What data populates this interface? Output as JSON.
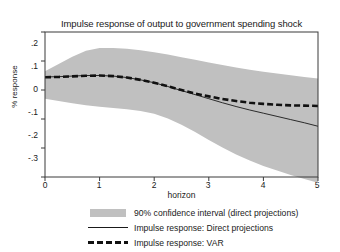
{
  "chart_data": {
    "type": "line",
    "title": "Impulse response of output to government spending shock",
    "xlabel": "horizon",
    "ylabel": "% response",
    "xlim": [
      0,
      5
    ],
    "ylim": [
      -0.3,
      0.2
    ],
    "xticks": [
      "0",
      "1",
      "2",
      "3",
      "4",
      "5"
    ],
    "xtick_values": [
      0,
      1,
      2,
      3,
      4,
      5
    ],
    "yticks": [
      ".2",
      ".1",
      "0",
      "-.1",
      "-.2",
      "-.3"
    ],
    "ytick_values": [
      0.2,
      0.1,
      0,
      -0.1,
      -0.2,
      -0.3
    ],
    "grid": false,
    "legend_position": "below",
    "x": [
      0,
      0.25,
      0.5,
      0.75,
      1,
      1.25,
      1.5,
      1.75,
      2,
      2.25,
      2.5,
      2.75,
      3,
      3.25,
      3.5,
      3.75,
      4,
      4.25,
      4.5,
      4.75,
      5
    ],
    "band": {
      "name": "90% confidence interval (direct projections)",
      "color": "#c0c0c0",
      "upper": [
        0.065,
        0.09,
        0.115,
        0.135,
        0.145,
        0.145,
        0.142,
        0.137,
        0.13,
        0.122,
        0.113,
        0.104,
        0.095,
        0.086,
        0.078,
        0.07,
        0.063,
        0.057,
        0.051,
        0.045,
        0.04
      ],
      "lower": [
        -0.03,
        -0.038,
        -0.046,
        -0.053,
        -0.058,
        -0.062,
        -0.066,
        -0.072,
        -0.082,
        -0.098,
        -0.12,
        -0.145,
        -0.172,
        -0.198,
        -0.222,
        -0.243,
        -0.262,
        -0.278,
        -0.293,
        -0.307,
        -0.32
      ]
    },
    "series": [
      {
        "name": "Impulse response: Direct projections",
        "style": "solid",
        "color": "#1a1a1a",
        "values": [
          0.045,
          0.046,
          0.048,
          0.05,
          0.05,
          0.048,
          0.043,
          0.035,
          0.025,
          0.012,
          -0.002,
          -0.016,
          -0.03,
          -0.044,
          -0.057,
          -0.069,
          -0.08,
          -0.091,
          -0.102,
          -0.113,
          -0.125
        ]
      },
      {
        "name": "Impulse response: VAR",
        "style": "dashed",
        "color": "#111111",
        "values": [
          0.044,
          0.045,
          0.047,
          0.049,
          0.05,
          0.048,
          0.043,
          0.035,
          0.025,
          0.013,
          0.0,
          -0.012,
          -0.022,
          -0.031,
          -0.038,
          -0.044,
          -0.048,
          -0.051,
          -0.053,
          -0.054,
          -0.055
        ]
      }
    ]
  },
  "legend": {
    "items": [
      {
        "label": "90% confidence interval (direct projections)",
        "marker": "swatch"
      },
      {
        "label": "Impulse response: Direct projections",
        "marker": "solid-line"
      },
      {
        "label": "Impulse response: VAR",
        "marker": "dashed-line"
      }
    ]
  }
}
